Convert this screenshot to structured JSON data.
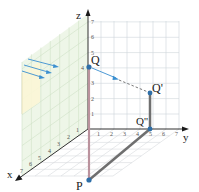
{
  "diagram": {
    "type": "3d-coordinate-projection",
    "axes": {
      "x": {
        "label": "x",
        "ticks": [
          "1",
          "2",
          "3",
          "4",
          "5",
          "6",
          "7"
        ]
      },
      "y": {
        "label": "y",
        "ticks": [
          "1",
          "2",
          "3",
          "4",
          "5",
          "6",
          "7"
        ]
      },
      "z": {
        "label": "z",
        "ticks": [
          "1",
          "2",
          "3",
          "4",
          "5",
          "6",
          "7"
        ]
      }
    },
    "points": [
      {
        "id": "Q",
        "label": "Q"
      },
      {
        "id": "Q_prime",
        "label": "Q'"
      },
      {
        "id": "Q_double_prime",
        "label": "Q''"
      },
      {
        "id": "P",
        "label": "P"
      }
    ],
    "colors": {
      "point": "#2e6fa8",
      "arrow": "#3a8fd0",
      "segment_QP": "#c9a0aa",
      "segment_QpQpp": "#777777",
      "segment_PQpp": "#777777",
      "grid": "#c9cfd4",
      "xz_wall_fill": "#eaf5e4",
      "projection_plane_fill": "#fbf6d6"
    }
  }
}
